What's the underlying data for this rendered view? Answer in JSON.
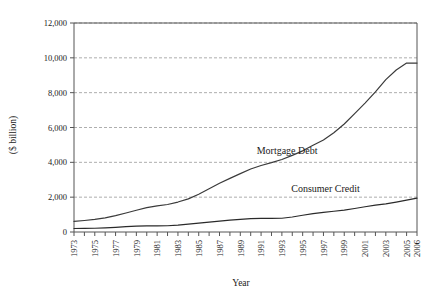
{
  "chart_data": {
    "type": "line",
    "title": "",
    "xlabel": "Year",
    "ylabel": "($ billion)",
    "xlim": [
      1973,
      2006
    ],
    "ylim": [
      0,
      12000
    ],
    "grid": true,
    "legend_position": "inline-annotations",
    "ytick_labels": [
      "0",
      "2,000",
      "4,000",
      "6,000",
      "8,000",
      "10,000",
      "12,000"
    ],
    "ytick_values": [
      0,
      2000,
      4000,
      6000,
      8000,
      10000,
      12000
    ],
    "xtick_labels": [
      "1973",
      "1975",
      "1977",
      "1979",
      "1981",
      "1983",
      "1985",
      "1987",
      "1989",
      "1991",
      "1993",
      "1995",
      "1997",
      "1999",
      "2001",
      "2003",
      "2005",
      "2006"
    ],
    "x": [
      1973,
      1974,
      1975,
      1976,
      1977,
      1978,
      1979,
      1980,
      1981,
      1982,
      1983,
      1984,
      1985,
      1986,
      1987,
      1988,
      1989,
      1990,
      1991,
      1992,
      1993,
      1994,
      1995,
      1996,
      1997,
      1998,
      1999,
      2000,
      2001,
      2002,
      2003,
      2004,
      2005,
      2006
    ],
    "series": [
      {
        "name": "Mortgage Debt",
        "color": "#3a3a3a",
        "values": [
          610,
          660,
          720,
          810,
          940,
          1090,
          1250,
          1400,
          1500,
          1580,
          1720,
          1900,
          2170,
          2480,
          2800,
          3080,
          3350,
          3620,
          3820,
          3980,
          4160,
          4400,
          4660,
          4980,
          5280,
          5700,
          6200,
          6800,
          7400,
          8050,
          8750,
          9300,
          9700,
          9700
        ]
      },
      {
        "name": "Consumer Credit",
        "color": "#2a2a2a",
        "values": [
          200,
          210,
          215,
          235,
          265,
          305,
          340,
          350,
          355,
          360,
          395,
          450,
          510,
          570,
          620,
          680,
          730,
          770,
          780,
          780,
          790,
          860,
          960,
          1060,
          1130,
          1190,
          1260,
          1350,
          1450,
          1540,
          1620,
          1720,
          1830,
          1950
        ]
      }
    ],
    "annotations": [
      {
        "text": "Mortgage Debt",
        "x": 1993.5,
        "y": 4450
      },
      {
        "text": "Consumer Credit",
        "x": 1997.2,
        "y": 2320
      }
    ]
  }
}
